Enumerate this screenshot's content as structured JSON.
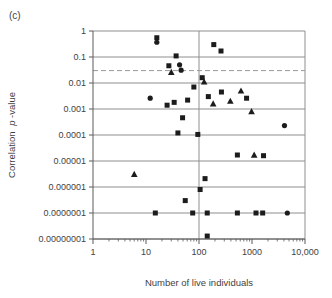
{
  "panel_label": "(c)",
  "chart_data": {
    "type": "scatter",
    "title": "",
    "xlabel": "Number of live individuals",
    "ylabel": "Correlation p-value",
    "ylabel_parts": {
      "prefix": "Correlation",
      "italic": "p",
      "suffix": "-value"
    },
    "x_scale": "log",
    "y_scale": "log",
    "xlim": [
      1,
      10000
    ],
    "ylim": [
      1e-08,
      1
    ],
    "x_ticks": {
      "labels": [
        "1",
        "10",
        "100",
        "1000",
        "10,000"
      ],
      "values": [
        1,
        10,
        100,
        1000,
        10000
      ]
    },
    "y_ticks": {
      "labels": [
        "1",
        "0.1",
        "0.01",
        "0.001",
        "0.0001",
        "0.00001",
        "0.000001",
        "0.0000001",
        "0.00000001"
      ],
      "values": [
        1,
        0.1,
        0.01,
        0.001,
        0.0001,
        1e-05,
        1e-06,
        1e-07,
        1e-08
      ]
    },
    "grid": {
      "horizontal_every_decade": true,
      "vertical_line_at_x": 100
    },
    "reference_line": {
      "y": 0.03,
      "style": "dashed"
    },
    "colors": {
      "marker": "#1c1c1c",
      "grid": "#8f8f8f",
      "axis": "#5a5a5a",
      "dashed": "#9a9a9a"
    },
    "series": [
      {
        "name": "squares",
        "marker": "square",
        "points": [
          [
            16,
            0.55
          ],
          [
            190,
            0.3
          ],
          [
            260,
            0.17
          ],
          [
            37,
            0.11
          ],
          [
            27,
            0.046
          ],
          [
            115,
            0.016
          ],
          [
            80,
            0.007
          ],
          [
            150,
            0.003
          ],
          [
            265,
            0.0045
          ],
          [
            790,
            0.0026
          ],
          [
            25,
            0.0014
          ],
          [
            34,
            0.0018
          ],
          [
            61,
            0.0022
          ],
          [
            49,
            0.00046
          ],
          [
            40,
            0.00012
          ],
          [
            95,
            0.000105
          ],
          [
            530,
            1.7e-05
          ],
          [
            1650,
            1.6e-05
          ],
          [
            130,
            2.1e-06
          ],
          [
            105,
            8e-07
          ],
          [
            55,
            3e-07
          ],
          [
            15,
            1e-07
          ],
          [
            76,
            1e-07
          ],
          [
            143,
            1e-07
          ],
          [
            530,
            1e-07
          ],
          [
            1190,
            1e-07
          ],
          [
            1590,
            1e-07
          ],
          [
            143,
            1.3e-08
          ]
        ]
      },
      {
        "name": "triangles",
        "marker": "triangle",
        "points": [
          [
            30,
            0.026
          ],
          [
            125,
            0.011
          ],
          [
            185,
            0.0016
          ],
          [
            390,
            0.002
          ],
          [
            620,
            0.005
          ],
          [
            980,
            0.0008
          ],
          [
            1100,
            1.7e-05
          ],
          [
            6,
            3.1e-06
          ]
        ]
      },
      {
        "name": "circles",
        "marker": "circle",
        "points": [
          [
            16,
            0.37
          ],
          [
            43,
            0.05
          ],
          [
            46,
            0.031
          ],
          [
            12,
            0.0026
          ],
          [
            4100,
            0.00023
          ],
          [
            4640,
            1e-07
          ]
        ]
      }
    ]
  }
}
